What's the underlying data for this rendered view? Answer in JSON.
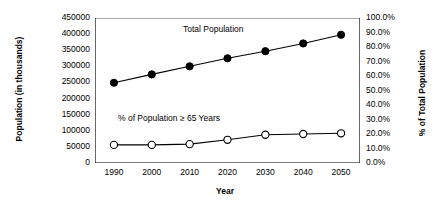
{
  "chart_data": {
    "type": "line",
    "title": "",
    "xlabel": "Year",
    "ylabel": "Population (in thousands)",
    "y2label": "% of Total Population",
    "categories": [
      "1990",
      "2000",
      "2010",
      "2020",
      "2030",
      "2040",
      "2050"
    ],
    "ylim": [
      0,
      450000
    ],
    "ytick_step": 50000,
    "yticks": [
      "450000",
      "400000",
      "350000",
      "300000",
      "250000",
      "200000",
      "150000",
      "100000",
      "50000",
      "0"
    ],
    "y2lim": [
      0,
      100
    ],
    "y2tick_step": 10,
    "y2ticks": [
      "100.0%",
      "90.0%",
      "80.0%",
      "70.0%",
      "60.0%",
      "50.0%",
      "40.0%",
      "30.0%",
      "20.0%",
      "10.0%",
      "0.0%"
    ],
    "grid": false,
    "legend": "annotations-inline",
    "series": [
      {
        "name": "Total Population",
        "axis": "left",
        "marker": "filled-circle",
        "color": "#000000",
        "values": [
          249000,
          275000,
          300000,
          325000,
          347000,
          371000,
          398000
        ]
      },
      {
        "name": "% of Population ≥ 65 Years",
        "axis": "right",
        "marker": "open-circle",
        "color": "#000000",
        "values": [
          12.5,
          12.5,
          13.0,
          16.0,
          19.5,
          20.0,
          20.5
        ]
      }
    ],
    "annotations": [
      {
        "text": "Total Population",
        "series": "Total Population"
      },
      {
        "text": "% of Population ≥ 65 Years",
        "series": "% of Population ≥ 65 Years"
      }
    ]
  }
}
